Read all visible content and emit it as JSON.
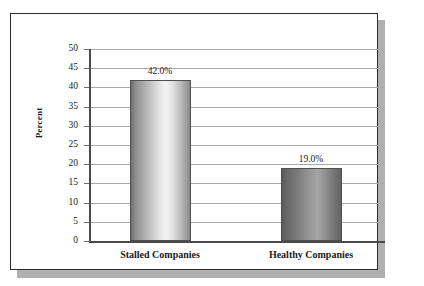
{
  "chart_data": {
    "type": "bar",
    "title": "",
    "xlabel": "",
    "ylabel": "Percent",
    "categories": [
      "Stalled Companies",
      "Healthy Companies"
    ],
    "values": [
      42.0,
      19.0
    ],
    "data_labels": [
      "42.0%",
      "19.0%"
    ],
    "ylim": [
      0,
      50
    ],
    "ytick_step": 5,
    "ytick_labels": [
      "50",
      "45",
      "40",
      "35",
      "30",
      "25",
      "20",
      "15",
      "10",
      "5",
      "0"
    ],
    "ytick_values": [
      50,
      45,
      40,
      35,
      30,
      25,
      20,
      15,
      10,
      5,
      0
    ],
    "grid": true,
    "legend": false,
    "legend_position": "none",
    "series": [
      {
        "name": "Percent",
        "values": [
          42.0,
          19.0
        ]
      }
    ]
  },
  "figure": {
    "y_axis_title": "Percent",
    "colors": {
      "frame_border": "#2b2b2b",
      "frame_shadow": "#b0b0b0",
      "gridline": "#a8a8a8",
      "axis_line": "#4a4a4a",
      "bar_light_highlight": "#f4f4f4",
      "bar_light_edge": "#6f6f6f",
      "bar_dark_highlight": "#a6a6a6",
      "bar_dark_edge": "#5c5c5c",
      "bar_outline": "#4f4f4f",
      "text": "#1a1a1a",
      "background": "#ffffff"
    }
  }
}
